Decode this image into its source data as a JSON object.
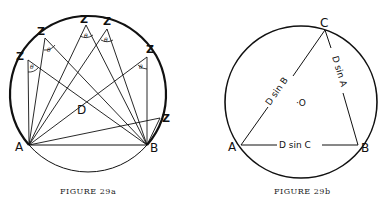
{
  "figures": [
    {
      "id": "29a",
      "caption": "Figure 29a",
      "caption_display": "FIGURE 29a",
      "points": {
        "A": "A",
        "B": "B",
        "D": "D"
      },
      "z_label": "Z",
      "theta_label": "θ",
      "z_count": 6
    },
    {
      "id": "29b",
      "caption": "Figure 29b",
      "caption_display": "FIGURE 29b",
      "points": {
        "A": "A",
        "B": "B",
        "C": "C",
        "O": "·O"
      },
      "sides": {
        "AC": "D sin B",
        "BC": "D sin A",
        "AB": "D sin C"
      }
    }
  ]
}
